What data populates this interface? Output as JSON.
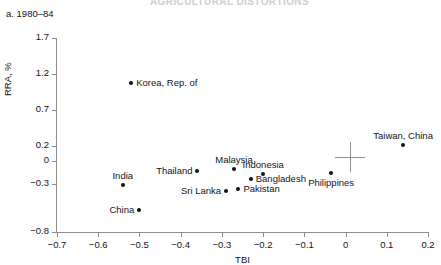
{
  "ghost_header_text": "AGRICULTURAL DISTORTIONS",
  "panel": {
    "title": "a. 1980–84"
  },
  "chart_data": {
    "type": "scatter",
    "title": "a. 1980–84",
    "xlabel": "TBI",
    "ylabel": "RRA, %",
    "xlim": [
      -0.7,
      0.2
    ],
    "ylim": [
      -0.8,
      1.7
    ],
    "grid": false,
    "legend": "none",
    "xticks": [
      -0.7,
      -0.6,
      -0.5,
      -0.4,
      -0.3,
      -0.2,
      -0.1,
      0,
      0.1,
      0.2
    ],
    "xtick_labels": [
      "−0.7",
      "−0.6",
      "−0.5",
      "−0.4",
      "−0.3",
      "−0.2",
      "−0.1",
      "0",
      "0.1",
      "0.2"
    ],
    "yticks": [
      1.7,
      1.2,
      0.7,
      0.2,
      0,
      -0.3,
      -0.8
    ],
    "ytick_labels": [
      "1.7",
      "1.2",
      "0.7",
      "0.2",
      "0",
      "−0.3",
      "−0.8"
    ],
    "points": [
      {
        "name": "Korea, Rep. of",
        "x": -0.52,
        "y": 1.08,
        "label_side": "right"
      },
      {
        "name": "India",
        "x": -0.54,
        "y": -0.31,
        "label_side": "above"
      },
      {
        "name": "China",
        "x": -0.5,
        "y": -0.57,
        "label_side": "left"
      },
      {
        "name": "Thailand",
        "x": -0.36,
        "y": -0.13,
        "label_side": "left"
      },
      {
        "name": "Malaysia",
        "x": -0.27,
        "y": -0.1,
        "label_side": "above"
      },
      {
        "name": "Sri Lanka",
        "x": -0.29,
        "y": -0.37,
        "label_side": "left"
      },
      {
        "name": "Pakistan",
        "x": -0.26,
        "y": -0.35,
        "label_side": "right"
      },
      {
        "name": "Bangladesh",
        "x": -0.23,
        "y": -0.23,
        "label_side": "right"
      },
      {
        "name": "Indonesia",
        "x": -0.2,
        "y": -0.17,
        "label_side": "above"
      },
      {
        "name": "Philippines",
        "x": -0.035,
        "y": -0.16,
        "label_side": "below"
      },
      {
        "name": "Taiwan, China",
        "x": 0.14,
        "y": 0.22,
        "label_side": "above"
      }
    ],
    "crosshair": {
      "x": 0.01,
      "y": 0.06,
      "size_px": 30
    }
  }
}
